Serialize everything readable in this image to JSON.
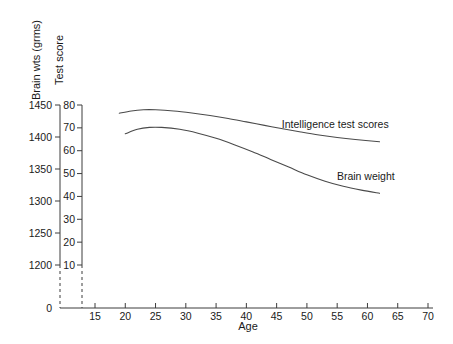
{
  "chart_data": {
    "type": "line",
    "title": "",
    "xlabel": "Age",
    "ylabel_left": "Brain wts (grms)",
    "ylabel_right": "Test score",
    "xlim": [
      15,
      70
    ],
    "xticks": [
      15,
      20,
      25,
      30,
      35,
      40,
      45,
      50,
      55,
      60,
      65,
      70
    ],
    "xtick_labels": [
      "15",
      "20",
      "25",
      "30",
      "35",
      "40",
      "45",
      "50",
      "55",
      "60",
      "65",
      "70"
    ],
    "ylim_left": [
      1200,
      1450
    ],
    "yticks_left": [
      1200,
      1250,
      1300,
      1350,
      1400,
      1450
    ],
    "ytick_labels_left": [
      "1200",
      "1250",
      "1300",
      "1350",
      "1400",
      "1450"
    ],
    "zero_label_left": "0",
    "ylim_right": [
      10,
      80
    ],
    "yticks_right": [
      10,
      20,
      30,
      40,
      50,
      60,
      70,
      80
    ],
    "ytick_labels_right": [
      "10",
      "20",
      "30",
      "40",
      "50",
      "60",
      "70",
      "80"
    ],
    "axis_break": true,
    "grid": false,
    "legend_position": "inline-right",
    "series": [
      {
        "name": "Intelligence test scores",
        "axis": "right",
        "units": "test score",
        "x": [
          19,
          21,
          23,
          25,
          28,
          31,
          34,
          37,
          40,
          43,
          46,
          49,
          52,
          55,
          58,
          62
        ],
        "values": [
          76.4,
          77.4,
          77.9,
          77.9,
          77.4,
          76.5,
          75.4,
          74.1,
          72.6,
          71.1,
          69.6,
          68.2,
          66.9,
          65.8,
          64.9,
          63.9
        ]
      },
      {
        "name": "Brain weight",
        "axis": "left",
        "units": "grms",
        "x": [
          20,
          22,
          24,
          26,
          29,
          32,
          35,
          38,
          41,
          44,
          47,
          50,
          53,
          56,
          59,
          62
        ],
        "values": [
          1405,
          1412,
          1415,
          1415,
          1412,
          1406,
          1398,
          1388,
          1377,
          1365,
          1353,
          1341,
          1331,
          1323,
          1317,
          1312
        ]
      }
    ],
    "annotations": [
      {
        "text": "Intelligence test scores",
        "x": 63.5,
        "y": 71.5,
        "axis": "right"
      },
      {
        "text": "Brain weight",
        "x": 64.5,
        "y": 1339,
        "axis": "left"
      }
    ]
  }
}
